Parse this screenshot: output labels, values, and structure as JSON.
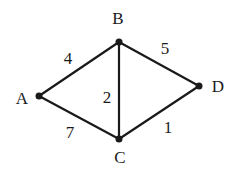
{
  "graph": {
    "type": "undirected-weighted",
    "nodes": [
      {
        "id": "A",
        "label": "A",
        "x": 39,
        "y": 96,
        "lx": 22,
        "ly": 104
      },
      {
        "id": "B",
        "label": "B",
        "x": 119,
        "y": 42,
        "lx": 118,
        "ly": 24
      },
      {
        "id": "C",
        "label": "C",
        "x": 119,
        "y": 139,
        "lx": 120,
        "ly": 163
      },
      {
        "id": "D",
        "label": "D",
        "x": 199,
        "y": 86,
        "lx": 218,
        "ly": 92
      }
    ],
    "edges": [
      {
        "from": "A",
        "to": "B",
        "weight": "4",
        "lx": 68,
        "ly": 64
      },
      {
        "from": "B",
        "to": "D",
        "weight": "5",
        "lx": 165,
        "ly": 54
      },
      {
        "from": "B",
        "to": "C",
        "weight": "2",
        "lx": 107,
        "ly": 103
      },
      {
        "from": "A",
        "to": "C",
        "weight": "7",
        "lx": 70,
        "ly": 138
      },
      {
        "from": "C",
        "to": "D",
        "weight": "1",
        "lx": 168,
        "ly": 133
      }
    ]
  }
}
